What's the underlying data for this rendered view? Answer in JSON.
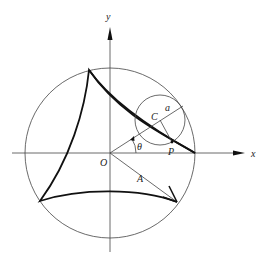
{
  "figure": {
    "type": "deltoid hypocycloid construction",
    "labels": {
      "y_axis": "y",
      "x_axis": "x",
      "origin": "O",
      "center": "C",
      "small_radius": "a",
      "angle": "θ",
      "point": "P",
      "large_radius": "A"
    },
    "geometry": {
      "origin_px": [
        110,
        153
      ],
      "large_circle_radius_px": 85,
      "small_circle_center_px": [
        160,
        120
      ],
      "small_circle_radius_px": 25,
      "point_P_px": [
        172,
        142
      ],
      "cusps_px": [
        [
          195,
          153
        ],
        [
          89,
          70
        ],
        [
          40,
          201
        ]
      ],
      "arrow_tip_px": [
        177,
        202
      ]
    },
    "colors": {
      "line": "#111111",
      "thin_line": "#444444",
      "background": "#ffffff"
    }
  }
}
